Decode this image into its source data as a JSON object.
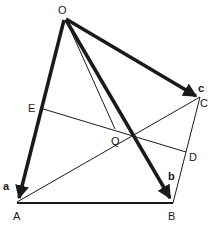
{
  "diagram": {
    "points": {
      "O": {
        "label": "O",
        "x": 65,
        "y": 20
      },
      "A": {
        "label": "A",
        "x": 17,
        "y": 202
      },
      "B": {
        "label": "B",
        "x": 173,
        "y": 203
      },
      "C": {
        "label": "C",
        "x": 200,
        "y": 97
      },
      "D": {
        "label": "D",
        "x": 186,
        "y": 152
      },
      "E": {
        "label": "E",
        "x": 40,
        "y": 108
      },
      "Q": {
        "label": "Q",
        "x": 115,
        "y": 129
      }
    },
    "vectors": {
      "a": {
        "label": "a",
        "from": "O",
        "to": "A"
      },
      "b": {
        "label": "b",
        "from": "O",
        "to": "B"
      },
      "c": {
        "label": "c",
        "from": "O",
        "to": "C"
      }
    },
    "colors": {
      "ink": "#1a1a1a",
      "background": "#ffffff"
    }
  }
}
